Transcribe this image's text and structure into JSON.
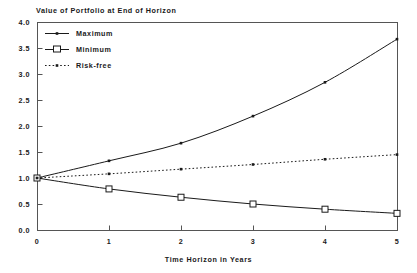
{
  "chart_data": {
    "type": "line",
    "title": "Value of Portfolio at End of Horizon",
    "xlabel": "Time Horizon in Years",
    "ylabel": "",
    "x": [
      0,
      1,
      2,
      3,
      4,
      5
    ],
    "xlim": [
      0,
      5
    ],
    "ylim": [
      0.0,
      4.0
    ],
    "xticks": [
      "0",
      "1",
      "2",
      "3",
      "4",
      "5"
    ],
    "yticks": [
      "0.0",
      "0.5",
      "1.0",
      "1.5",
      "2.0",
      "2.5",
      "3.0",
      "3.5",
      "4.0"
    ],
    "grid": false,
    "legend_position": "upper left",
    "series": [
      {
        "name": "Maximum",
        "marker": "dot",
        "linestyle": "solid",
        "color": "#1a1a1a",
        "values": [
          1.0,
          1.33,
          1.67,
          2.19,
          2.84,
          3.67
        ]
      },
      {
        "name": "Minimum",
        "marker": "square",
        "linestyle": "solid",
        "color": "#1a1a1a",
        "values": [
          1.0,
          0.79,
          0.63,
          0.5,
          0.4,
          0.32
        ]
      },
      {
        "name": "Risk-free",
        "marker": "dot",
        "linestyle": "dotted",
        "color": "#1a1a1a",
        "values": [
          1.0,
          1.08,
          1.17,
          1.26,
          1.36,
          1.45
        ]
      }
    ]
  },
  "figure": {
    "caption": ""
  }
}
